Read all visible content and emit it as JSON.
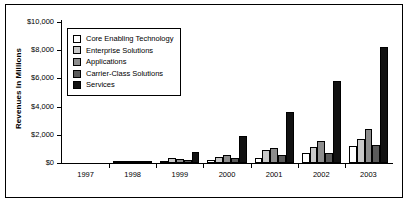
{
  "chart_data": {
    "type": "bar",
    "title": "",
    "xlabel": "",
    "ylabel": "Revenues In Millions",
    "categories": [
      "1997",
      "1998",
      "1999",
      "2000",
      "2001",
      "2002",
      "2003"
    ],
    "ylim": [
      0,
      10000
    ],
    "yticks": [
      0,
      2000,
      4000,
      6000,
      8000,
      10000
    ],
    "ytick_labels": [
      "$0",
      "$2,000",
      "$4,000",
      "$6,000",
      "$8,000",
      "$10,000"
    ],
    "grid": false,
    "legend_position": "upper left inside plot",
    "series": [
      {
        "name": "Core Enabling Technology",
        "color": "#ffffff",
        "values": [
          0,
          60,
          150,
          220,
          330,
          700,
          1200
        ]
      },
      {
        "name": "Enterprise Solutions",
        "color": "#c8c8c8",
        "values": [
          0,
          80,
          350,
          400,
          900,
          1150,
          1700
        ]
      },
      {
        "name": "Applications",
        "color": "#8c8c8c",
        "values": [
          0,
          70,
          300,
          560,
          1100,
          1550,
          2400
        ]
      },
      {
        "name": "Carrier-Class Solutions",
        "color": "#5a5a5a",
        "values": [
          0,
          90,
          180,
          330,
          560,
          700,
          1250
        ]
      },
      {
        "name": "Services",
        "color": "#111111",
        "values": [
          0,
          130,
          800,
          1900,
          3650,
          5800,
          8200
        ]
      }
    ]
  },
  "legend": {
    "items": [
      {
        "label": "Core Enabling Technology",
        "color": "#ffffff"
      },
      {
        "label": "Enterprise Solutions",
        "color": "#c8c8c8"
      },
      {
        "label": "Applications",
        "color": "#8c8c8c"
      },
      {
        "label": "Carrier-Class Solutions",
        "color": "#5a5a5a"
      },
      {
        "label": "Services",
        "color": "#111111"
      }
    ]
  }
}
